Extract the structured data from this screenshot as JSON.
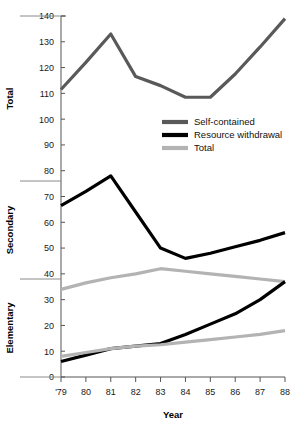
{
  "chart_data": {
    "type": "line",
    "title": "",
    "xlabel": "Year",
    "ylabel": "",
    "panel_labels": [
      "Total",
      "Secondary",
      "Elementary"
    ],
    "x": [
      79,
      80,
      81,
      82,
      83,
      84,
      85,
      86,
      87,
      88
    ],
    "xtick_labels": [
      "'79",
      "80",
      "81",
      "82",
      "83",
      "84",
      "85",
      "86",
      "87",
      "88"
    ],
    "ytick_labels": [
      "0",
      "10",
      "20",
      "30",
      "40",
      "50",
      "60",
      "70",
      "80",
      "90",
      "100",
      "110",
      "120",
      "130",
      "140"
    ],
    "ytick_values": [
      0,
      10,
      20,
      30,
      40,
      50,
      60,
      70,
      80,
      90,
      100,
      110,
      120,
      130,
      140
    ],
    "ylim": [
      0,
      140
    ],
    "grid": false,
    "panel_separators": [
      76,
      38
    ],
    "legend_position": "center-right",
    "series": [
      {
        "name": "Self-contained",
        "panel": "Total",
        "color": "#595959",
        "values": [
          111.5,
          122.0,
          133.0,
          116.5,
          113.0,
          108.5,
          108.5,
          117.5,
          128.0,
          139.0
        ]
      },
      {
        "name": "Resource withdrawal",
        "panel": "Secondary",
        "color": "#000000",
        "values": [
          66.5,
          72.0,
          78.0,
          64.0,
          50.0,
          46.0,
          48.0,
          50.5,
          53.0,
          56.0
        ]
      },
      {
        "name": "Total",
        "panel": "Secondary",
        "color": "#b3b3b3",
        "values": [
          34.0,
          36.5,
          38.5,
          40.0,
          42.0,
          41.0,
          40.0,
          39.0,
          38.0,
          37.0
        ]
      },
      {
        "name": "Resource withdrawal",
        "panel": "Elementary",
        "color": "#000000",
        "values": [
          6.0,
          8.5,
          11.0,
          12.0,
          13.0,
          16.5,
          20.5,
          24.5,
          30.0,
          37.0
        ]
      },
      {
        "name": "Total",
        "panel": "Elementary",
        "color": "#b3b3b3",
        "values": [
          8.0,
          9.5,
          11.0,
          12.0,
          12.5,
          13.5,
          14.5,
          15.5,
          16.5,
          18.0
        ]
      }
    ]
  },
  "legend": {
    "entries": [
      {
        "label": "Self-contained",
        "color": "#595959"
      },
      {
        "label": "Resource withdrawal",
        "color": "#000000"
      },
      {
        "label": "Total",
        "color": "#b3b3b3"
      }
    ]
  }
}
